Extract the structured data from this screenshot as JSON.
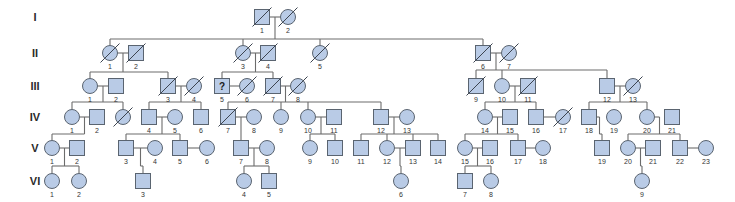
{
  "legend": {
    "question_mark": "?"
  },
  "generations": [
    {
      "label": "I",
      "individuals": [
        {
          "id": "1",
          "sex": "M",
          "deceased": true
        },
        {
          "id": "2",
          "sex": "F",
          "deceased": true
        }
      ]
    },
    {
      "label": "II",
      "individuals": [
        {
          "id": "1",
          "sex": "F",
          "deceased": true
        },
        {
          "id": "2",
          "sex": "M",
          "deceased": true
        },
        {
          "id": "3",
          "sex": "F",
          "deceased": true
        },
        {
          "id": "4",
          "sex": "M",
          "deceased": true
        },
        {
          "id": "5",
          "sex": "F",
          "deceased": true
        },
        {
          "id": "6",
          "sex": "M",
          "deceased": true
        },
        {
          "id": "7",
          "sex": "F",
          "deceased": true
        }
      ]
    },
    {
      "label": "III",
      "individuals": [
        {
          "id": "1",
          "sex": "F",
          "deceased": false
        },
        {
          "id": "2",
          "sex": "M",
          "deceased": false
        },
        {
          "id": "3",
          "sex": "M",
          "deceased": true
        },
        {
          "id": "4",
          "sex": "F",
          "deceased": true
        },
        {
          "id": "5",
          "sex": "M",
          "deceased": false,
          "mark": "?"
        },
        {
          "id": "6",
          "sex": "F",
          "deceased": true
        },
        {
          "id": "7",
          "sex": "M",
          "deceased": true
        },
        {
          "id": "8",
          "sex": "F",
          "deceased": true
        },
        {
          "id": "9",
          "sex": "M",
          "deceased": true
        },
        {
          "id": "10",
          "sex": "F",
          "deceased": false
        },
        {
          "id": "11",
          "sex": "M",
          "deceased": true
        },
        {
          "id": "12",
          "sex": "M",
          "deceased": false
        },
        {
          "id": "13",
          "sex": "F",
          "deceased": true
        }
      ]
    },
    {
      "label": "IV",
      "individuals": [
        {
          "id": "1",
          "sex": "F",
          "deceased": false
        },
        {
          "id": "2",
          "sex": "M",
          "deceased": false
        },
        {
          "id": "",
          "sex": "F",
          "deceased": true
        },
        {
          "id": "4",
          "sex": "M",
          "deceased": false
        },
        {
          "id": "5",
          "sex": "F",
          "deceased": false
        },
        {
          "id": "6",
          "sex": "M",
          "deceased": false
        },
        {
          "id": "7",
          "sex": "M",
          "deceased": true
        },
        {
          "id": "8",
          "sex": "F",
          "deceased": false
        },
        {
          "id": "9",
          "sex": "F",
          "deceased": false
        },
        {
          "id": "10",
          "sex": "F",
          "deceased": false
        },
        {
          "id": "11",
          "sex": "M",
          "deceased": false
        },
        {
          "id": "12",
          "sex": "M",
          "deceased": false
        },
        {
          "id": "13",
          "sex": "F",
          "deceased": false
        },
        {
          "id": "14",
          "sex": "F",
          "deceased": false
        },
        {
          "id": "15",
          "sex": "M",
          "deceased": false
        },
        {
          "id": "16",
          "sex": "M",
          "deceased": false
        },
        {
          "id": "17",
          "sex": "F",
          "deceased": true
        },
        {
          "id": "18",
          "sex": "M",
          "deceased": false
        },
        {
          "id": "19",
          "sex": "F",
          "deceased": false
        },
        {
          "id": "20",
          "sex": "F",
          "deceased": false
        },
        {
          "id": "21",
          "sex": "M",
          "deceased": false
        }
      ]
    },
    {
      "label": "V",
      "individuals": [
        {
          "id": "1",
          "sex": "F",
          "deceased": false
        },
        {
          "id": "2",
          "sex": "M",
          "deceased": false
        },
        {
          "id": "3",
          "sex": "M",
          "deceased": false
        },
        {
          "id": "4",
          "sex": "F",
          "deceased": false
        },
        {
          "id": "5",
          "sex": "M",
          "deceased": false
        },
        {
          "id": "6",
          "sex": "F",
          "deceased": false
        },
        {
          "id": "7",
          "sex": "M",
          "deceased": false
        },
        {
          "id": "8",
          "sex": "F",
          "deceased": false
        },
        {
          "id": "9",
          "sex": "F",
          "deceased": false
        },
        {
          "id": "10",
          "sex": "M",
          "deceased": false
        },
        {
          "id": "11",
          "sex": "M",
          "deceased": false
        },
        {
          "id": "12",
          "sex": "F",
          "deceased": false
        },
        {
          "id": "13",
          "sex": "M",
          "deceased": false
        },
        {
          "id": "14",
          "sex": "M",
          "deceased": false
        },
        {
          "id": "15",
          "sex": "F",
          "deceased": false
        },
        {
          "id": "16",
          "sex": "M",
          "deceased": false
        },
        {
          "id": "17",
          "sex": "M",
          "deceased": false
        },
        {
          "id": "18",
          "sex": "F",
          "deceased": false
        },
        {
          "id": "19",
          "sex": "M",
          "deceased": false
        },
        {
          "id": "20",
          "sex": "F",
          "deceased": false
        },
        {
          "id": "21",
          "sex": "M",
          "deceased": false
        },
        {
          "id": "22",
          "sex": "M",
          "deceased": false
        },
        {
          "id": "23",
          "sex": "F",
          "deceased": false
        }
      ]
    },
    {
      "label": "VI",
      "individuals": [
        {
          "id": "1",
          "sex": "F",
          "deceased": false
        },
        {
          "id": "2",
          "sex": "F",
          "deceased": false
        },
        {
          "id": "3",
          "sex": "M",
          "deceased": false
        },
        {
          "id": "4",
          "sex": "F",
          "deceased": false
        },
        {
          "id": "5",
          "sex": "M",
          "deceased": false
        },
        {
          "id": "6",
          "sex": "F",
          "deceased": false
        },
        {
          "id": "7",
          "sex": "M",
          "deceased": false
        },
        {
          "id": "8",
          "sex": "F",
          "deceased": false
        },
        {
          "id": "9",
          "sex": "F",
          "deceased": false
        }
      ]
    }
  ],
  "colors": {
    "fill": "#b9cbe6",
    "stroke": "#5a6470",
    "line": "#6c6c6c"
  }
}
